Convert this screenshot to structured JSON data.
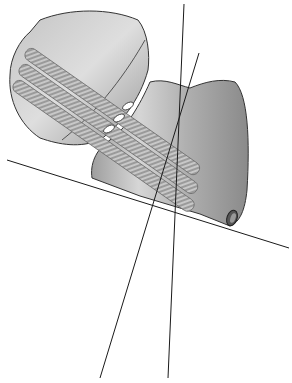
{
  "figure": {
    "background": "#ffffff",
    "colors": {
      "bone_fill": "#b8b8b8",
      "bone_light": "#d8d8d8",
      "bone_stroke": "#333333",
      "screw_fill": "#8f8f8f",
      "line": "#1a1a1a"
    },
    "lines": [
      {
        "id": "reference-line-horizontal",
        "x1": 7,
        "y1": 160,
        "x2": 289,
        "y2": 248
      },
      {
        "id": "reference-line-steep",
        "x1": 184,
        "y1": 4,
        "x2": 168,
        "y2": 378
      },
      {
        "id": "reference-line-oblique",
        "x1": 199,
        "y1": 53,
        "x2": 100,
        "y2": 378
      }
    ],
    "screws": 3
  }
}
